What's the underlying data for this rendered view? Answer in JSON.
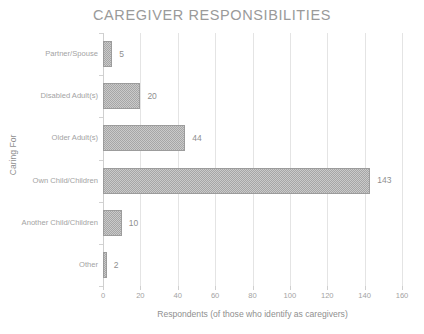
{
  "chart_data": {
    "type": "bar",
    "orientation": "horizontal",
    "title": "CAREGIVER RESPONSIBILITIES",
    "xlabel": "Respondents (of those who identify as caregivers)",
    "ylabel": "Caring For",
    "categories": [
      "Partner/Spouse",
      "Disabled Adult(s)",
      "Older Adult(s)",
      "Own Child/Children",
      "Another Child/Children",
      "Other"
    ],
    "values": [
      5,
      20,
      44,
      143,
      10,
      2
    ],
    "value_labels": [
      "5",
      "20",
      "44",
      "143",
      "10",
      "2"
    ],
    "xlim": [
      0,
      160
    ],
    "xticks": [
      0,
      20,
      40,
      60,
      80,
      100,
      120,
      140,
      160
    ],
    "xtick_labels": [
      "0",
      "20",
      "40",
      "60",
      "80",
      "100",
      "120",
      "140",
      "160"
    ],
    "grid": "vertical",
    "legend": "none",
    "bar_color": "#a6a6a6",
    "bar_border_color": "#9c9c9c",
    "text_color": "#a3a3a3",
    "title_color": "#9a9a9a",
    "gridline_color": "#e4e4e4",
    "background": "#ffffff"
  }
}
